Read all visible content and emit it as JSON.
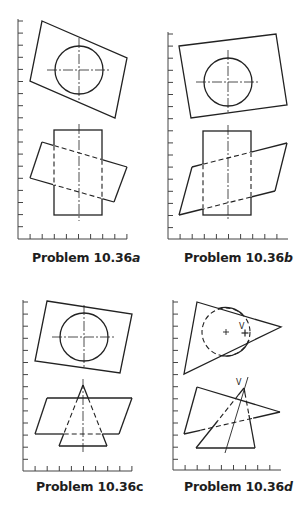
{
  "figure": {
    "panels": [
      {
        "id": "a",
        "caption_prefix": "Problem 10.36",
        "caption_suffix": "a",
        "suffix_italic": true,
        "caption_pos": [
          32,
          258
        ],
        "axis": {
          "x": 18,
          "y_top": 21,
          "y_bottom": 239,
          "x_right": 127,
          "tick_spacing": 12.1
        },
        "top_quad": [
          [
            42,
            21
          ],
          [
            127,
            58
          ],
          [
            115,
            118
          ],
          [
            30,
            81
          ]
        ],
        "top_circle": {
          "cx": 79,
          "cy": 70,
          "r": 24
        },
        "bottom_rect": {
          "x1": 54,
          "y1": 130,
          "x2": 102,
          "y2": 215
        },
        "bottom_quad": [
          [
            42,
            142
          ],
          [
            127,
            167
          ],
          [
            114,
            202
          ],
          [
            30,
            178
          ]
        ],
        "centerline_x": 79
      },
      {
        "id": "b",
        "caption_prefix": "Problem 10.36",
        "caption_suffix": "b",
        "suffix_italic": true,
        "caption_pos": [
          186,
          258
        ],
        "axis": {
          "x": 168,
          "y_top": 34,
          "y_bottom": 239,
          "x_right": 288,
          "tick_spacing": 12.1
        },
        "top_quad": [
          [
            179,
            46
          ],
          [
            276,
            34
          ],
          [
            287,
            105
          ],
          [
            191,
            118
          ]
        ],
        "top_circle": {
          "cx": 228,
          "cy": 82,
          "r": 24
        },
        "bottom_rect": {
          "x1": 203,
          "y1": 131,
          "x2": 251,
          "y2": 215
        },
        "bottom_quad": [
          [
            192,
            167
          ],
          [
            287,
            143
          ],
          [
            275,
            191
          ],
          [
            179,
            215
          ]
        ],
        "centerline_x": 228
      },
      {
        "id": "c",
        "caption_prefix": "Problem 10.36",
        "caption_suffix": "c",
        "suffix_italic": false,
        "caption_pos": [
          36,
          487
        ],
        "axis": {
          "x": 23,
          "y_top": 302,
          "y_bottom": 471,
          "x_right": 132,
          "tick_spacing": 12.1
        },
        "top_quad": [
          [
            47,
            301
          ],
          [
            132,
            314
          ],
          [
            120,
            373
          ],
          [
            35,
            361
          ]
        ],
        "top_circle": {
          "cx": 84,
          "cy": 337,
          "r": 24
        },
        "bottom_quad": [
          [
            47,
            398
          ],
          [
            132,
            398
          ],
          [
            119,
            434
          ],
          [
            35,
            434
          ]
        ],
        "triangle": {
          "apex": [
            83,
            385
          ],
          "base_left": [
            59,
            446
          ],
          "base_right": [
            107,
            446
          ]
        },
        "centerline_x": 83
      },
      {
        "id": "d",
        "caption_prefix": "Problem 10.36",
        "caption_suffix": "d",
        "suffix_italic": true,
        "caption_pos": [
          186,
          487
        ],
        "axis": {
          "x": 173,
          "y_top": 302,
          "y_bottom": 470,
          "x_right": 281,
          "tick_spacing": 12.1
        },
        "top_triangle": [
          [
            197,
            302
          ],
          [
            281,
            327
          ],
          [
            184,
            374
          ]
        ],
        "top_circle": {
          "cx": 226,
          "cy": 332,
          "r": 24
        },
        "center_mark": [
          226,
          332
        ],
        "v_mark": [
          245,
          333
        ],
        "v_label": "V",
        "bottom_triangle_plane": [
          [
            197,
            387
          ],
          [
            280,
            412
          ],
          [
            184,
            434
          ]
        ],
        "bottom_pyramid": {
          "apex": [
            244,
            388
          ],
          "base_left": [
            196,
            448
          ],
          "base_right": [
            255,
            448
          ]
        },
        "slant_line": [
          [
            248,
            377
          ],
          [
            225,
            453
          ]
        ],
        "v_label_bottom": "V"
      }
    ]
  }
}
